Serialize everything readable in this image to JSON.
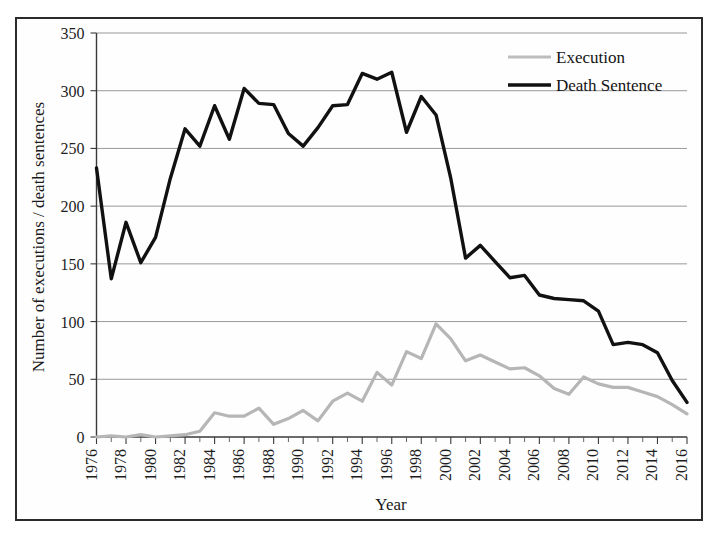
{
  "figure": {
    "background": "#ffffff",
    "frame_color": "#2b2b2b"
  },
  "axis": {
    "x_title": "Year",
    "y_title": "Number of executions / death sentences",
    "y_ticks": [
      "0",
      "50",
      "100",
      "150",
      "200",
      "250",
      "300",
      "350"
    ],
    "x_ticks": [
      "1976",
      "1978",
      "1980",
      "1982",
      "1984",
      "1986",
      "1988",
      "1990",
      "1992",
      "1994",
      "1996",
      "1998",
      "2000",
      "2002",
      "2004",
      "2006",
      "2008",
      "2010",
      "2012",
      "2014",
      "2016"
    ]
  },
  "legend": {
    "position": "top-right",
    "items": [
      {
        "label": "Execution",
        "color": "#bdbdbd"
      },
      {
        "label": "Death Sentence",
        "color": "#111111"
      }
    ]
  },
  "chart_data": {
    "type": "line",
    "title": "",
    "xlabel": "Year",
    "ylabel": "Number of executions / death sentences",
    "xlim": [
      1976,
      2016
    ],
    "ylim": [
      0,
      350
    ],
    "ytick_step": 50,
    "grid": "horizontal",
    "legend_position": "top-right",
    "x": [
      1976,
      1977,
      1978,
      1979,
      1980,
      1981,
      1982,
      1983,
      1984,
      1985,
      1986,
      1987,
      1988,
      1989,
      1990,
      1991,
      1992,
      1993,
      1994,
      1995,
      1996,
      1997,
      1998,
      1999,
      2000,
      2001,
      2002,
      2003,
      2004,
      2005,
      2006,
      2007,
      2008,
      2009,
      2010,
      2011,
      2012,
      2013,
      2014,
      2015,
      2016
    ],
    "series": [
      {
        "name": "Execution",
        "color": "#bdbdbd",
        "values": [
          0,
          1,
          0,
          2,
          0,
          1,
          2,
          5,
          21,
          18,
          18,
          25,
          11,
          16,
          23,
          14,
          31,
          38,
          31,
          56,
          45,
          74,
          68,
          98,
          85,
          66,
          71,
          65,
          59,
          60,
          53,
          42,
          37,
          52,
          46,
          43,
          43,
          39,
          35,
          28,
          20
        ]
      },
      {
        "name": "Death Sentence",
        "color": "#111111",
        "values": [
          233,
          137,
          186,
          151,
          173,
          224,
          267,
          252,
          287,
          258,
          302,
          289,
          288,
          263,
          252,
          268,
          287,
          288,
          315,
          310,
          316,
          264,
          295,
          279,
          224,
          155,
          166,
          152,
          138,
          140,
          123,
          120,
          119,
          118,
          109,
          80,
          82,
          80,
          73,
          49,
          30
        ]
      }
    ]
  }
}
